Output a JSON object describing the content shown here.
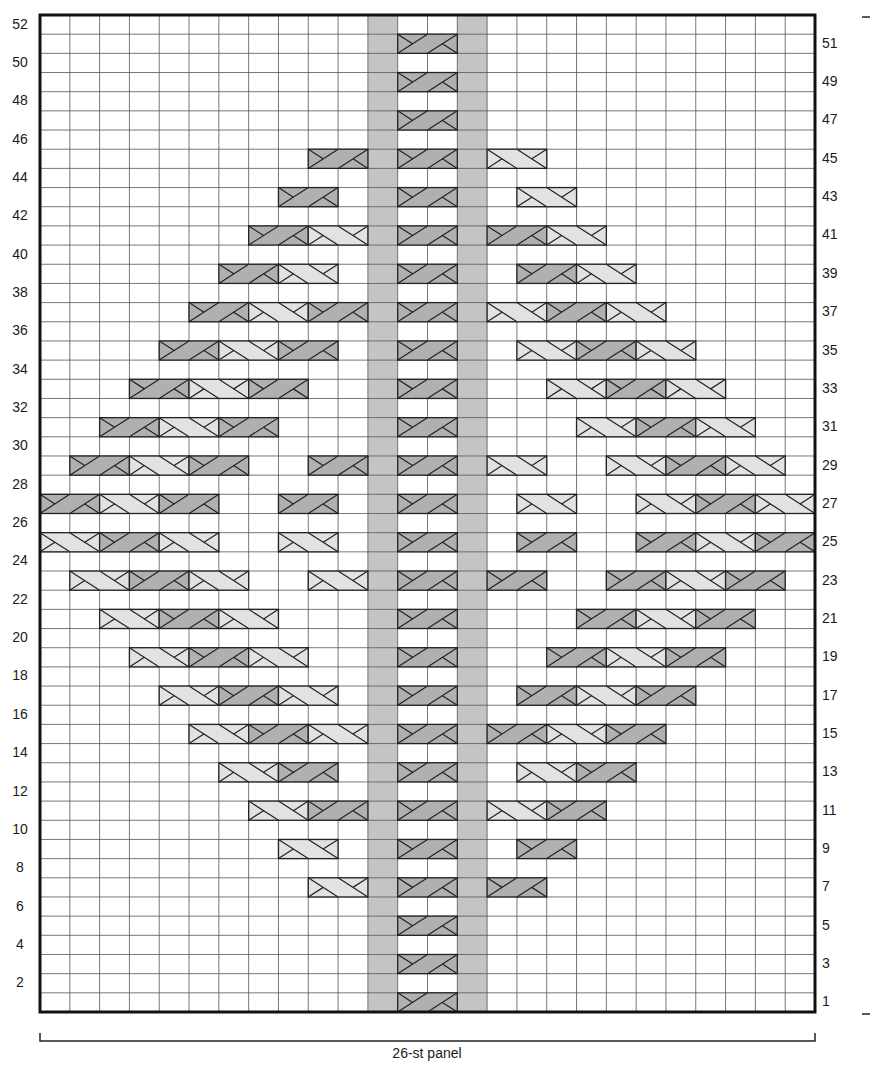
{
  "chart": {
    "title": "",
    "type": "knitting-cable-chart",
    "columns": 26,
    "rows": 52,
    "panel_label": "26-st panel",
    "left_row_labels": [
      "2",
      "4",
      "6",
      "8",
      "10",
      "12",
      "14",
      "16",
      "18",
      "20",
      "22",
      "24",
      "26",
      "28",
      "30",
      "32",
      "34",
      "36",
      "38",
      "40",
      "42",
      "44",
      "46",
      "48",
      "50",
      "52"
    ],
    "right_row_labels": [
      "1",
      "3",
      "5",
      "7",
      "9",
      "11",
      "13",
      "15",
      "17",
      "19",
      "21",
      "23",
      "25",
      "27",
      "29",
      "31",
      "33",
      "35",
      "37",
      "39",
      "41",
      "43",
      "45",
      "47",
      "49",
      "51"
    ],
    "colors": {
      "grid_line": "#555555",
      "border": "#111111",
      "purl_column_fill": "#c4c4c4",
      "dark_cable_fill": "#b0b0b0",
      "light_cable_fill": "#e2e2e2",
      "background": "#ffffff"
    },
    "shaded_columns": [
      12,
      15
    ],
    "legend": {
      "D": "right-cross cable over 2 sts (dark)",
      "L": "left-cross cable over 2 sts (light)"
    }
  },
  "chart_data": {
    "type": "table",
    "xlabel": "26-st panel",
    "columns": 26,
    "rows": 52,
    "shaded_columns": [
      12,
      15
    ],
    "cables_by_row": {
      "1": [
        [
          13,
          "D"
        ]
      ],
      "3": [
        [
          13,
          "D"
        ]
      ],
      "5": [
        [
          13,
          "D"
        ]
      ],
      "7": [
        [
          10,
          "L"
        ],
        [
          13,
          "D"
        ],
        [
          16,
          "D"
        ]
      ],
      "9": [
        [
          9,
          "L"
        ],
        [
          13,
          "D"
        ],
        [
          17,
          "D"
        ]
      ],
      "11": [
        [
          8,
          "L"
        ],
        [
          10,
          "D"
        ],
        [
          13,
          "D"
        ],
        [
          16,
          "L"
        ],
        [
          18,
          "D"
        ]
      ],
      "13": [
        [
          7,
          "L"
        ],
        [
          9,
          "D"
        ],
        [
          13,
          "D"
        ],
        [
          17,
          "L"
        ],
        [
          19,
          "D"
        ]
      ],
      "15": [
        [
          6,
          "L"
        ],
        [
          8,
          "D"
        ],
        [
          10,
          "L"
        ],
        [
          13,
          "D"
        ],
        [
          16,
          "D"
        ],
        [
          18,
          "L"
        ],
        [
          20,
          "D"
        ]
      ],
      "17": [
        [
          5,
          "L"
        ],
        [
          7,
          "D"
        ],
        [
          9,
          "L"
        ],
        [
          13,
          "D"
        ],
        [
          17,
          "D"
        ],
        [
          19,
          "L"
        ],
        [
          21,
          "D"
        ]
      ],
      "19": [
        [
          4,
          "L"
        ],
        [
          6,
          "D"
        ],
        [
          8,
          "L"
        ],
        [
          13,
          "D"
        ],
        [
          18,
          "D"
        ],
        [
          20,
          "L"
        ],
        [
          22,
          "D"
        ]
      ],
      "21": [
        [
          3,
          "L"
        ],
        [
          5,
          "D"
        ],
        [
          7,
          "L"
        ],
        [
          13,
          "D"
        ],
        [
          19,
          "D"
        ],
        [
          21,
          "L"
        ],
        [
          23,
          "D"
        ]
      ],
      "23": [
        [
          2,
          "L"
        ],
        [
          4,
          "D"
        ],
        [
          6,
          "L"
        ],
        [
          10,
          "L"
        ],
        [
          13,
          "D"
        ],
        [
          16,
          "D"
        ],
        [
          20,
          "D"
        ],
        [
          22,
          "L"
        ],
        [
          24,
          "D"
        ]
      ],
      "25": [
        [
          1,
          "L"
        ],
        [
          3,
          "D"
        ],
        [
          5,
          "L"
        ],
        [
          9,
          "L"
        ],
        [
          13,
          "D"
        ],
        [
          17,
          "D"
        ],
        [
          21,
          "D"
        ],
        [
          23,
          "L"
        ],
        [
          25,
          "D"
        ]
      ],
      "27": [
        [
          1,
          "D"
        ],
        [
          3,
          "L"
        ],
        [
          5,
          "D"
        ],
        [
          9,
          "D"
        ],
        [
          13,
          "D"
        ],
        [
          17,
          "L"
        ],
        [
          21,
          "L"
        ],
        [
          23,
          "D"
        ],
        [
          25,
          "L"
        ]
      ],
      "29": [
        [
          2,
          "D"
        ],
        [
          4,
          "L"
        ],
        [
          6,
          "D"
        ],
        [
          10,
          "D"
        ],
        [
          13,
          "D"
        ],
        [
          16,
          "L"
        ],
        [
          20,
          "L"
        ],
        [
          22,
          "D"
        ],
        [
          24,
          "L"
        ]
      ],
      "31": [
        [
          3,
          "D"
        ],
        [
          5,
          "L"
        ],
        [
          7,
          "D"
        ],
        [
          13,
          "D"
        ],
        [
          19,
          "L"
        ],
        [
          21,
          "D"
        ],
        [
          23,
          "L"
        ]
      ],
      "33": [
        [
          4,
          "D"
        ],
        [
          6,
          "L"
        ],
        [
          8,
          "D"
        ],
        [
          13,
          "D"
        ],
        [
          18,
          "L"
        ],
        [
          20,
          "D"
        ],
        [
          22,
          "L"
        ]
      ],
      "35": [
        [
          5,
          "D"
        ],
        [
          7,
          "L"
        ],
        [
          9,
          "D"
        ],
        [
          13,
          "D"
        ],
        [
          17,
          "L"
        ],
        [
          19,
          "D"
        ],
        [
          21,
          "L"
        ]
      ],
      "37": [
        [
          6,
          "D"
        ],
        [
          8,
          "L"
        ],
        [
          10,
          "D"
        ],
        [
          13,
          "D"
        ],
        [
          16,
          "L"
        ],
        [
          18,
          "D"
        ],
        [
          20,
          "L"
        ]
      ],
      "39": [
        [
          7,
          "D"
        ],
        [
          9,
          "L"
        ],
        [
          13,
          "D"
        ],
        [
          17,
          "D"
        ],
        [
          19,
          "L"
        ]
      ],
      "41": [
        [
          8,
          "D"
        ],
        [
          10,
          "L"
        ],
        [
          13,
          "D"
        ],
        [
          16,
          "D"
        ],
        [
          18,
          "L"
        ]
      ],
      "43": [
        [
          9,
          "D"
        ],
        [
          13,
          "D"
        ],
        [
          17,
          "L"
        ]
      ],
      "45": [
        [
          10,
          "D"
        ],
        [
          13,
          "D"
        ],
        [
          16,
          "L"
        ]
      ],
      "47": [
        [
          13,
          "D"
        ]
      ],
      "49": [
        [
          13,
          "D"
        ]
      ],
      "51": [
        [
          13,
          "D"
        ]
      ]
    }
  }
}
